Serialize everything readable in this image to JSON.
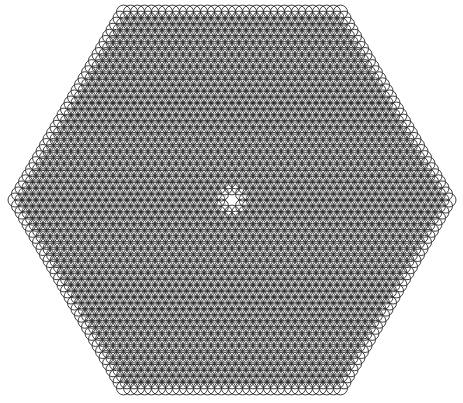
{
  "figure": {
    "name": "hexagonal-overlapping-circle-lattice",
    "title": "Hexagonal lattice of overlapping circles"
  },
  "canvas": {
    "width": 463,
    "height": 403,
    "background_color": "#ffffff"
  },
  "style": {
    "stroke_color": "#2b2b2b",
    "stroke_width": 0.9,
    "fill": "none"
  },
  "chart_data": {
    "type": "scatter",
    "title": "Hexagonal lattice of overlapping circles",
    "xlabel": "",
    "ylabel": "",
    "grid": false,
    "legend": null,
    "annotations": [
      "flat-top hexagonal boundary",
      "six-pointed star void at centre",
      "moire interference rosettes"
    ],
    "lattice": {
      "kind": "triangular",
      "center_x": 232.0,
      "center_y": 200.0,
      "spacing_x": 7.0,
      "spacing_y": 6.062,
      "circle_radius": 7.0,
      "rows": 62,
      "hexagon_flat_top": true,
      "hexagon_half_width": 218,
      "hexagon_half_height": 188,
      "top_edge_y": 13,
      "bottom_edge_y": 387,
      "left_vertex_x": 14,
      "right_vertex_x": 450,
      "top_edge_x_start": 122,
      "top_edge_x_end": 341,
      "center_star_radius": 11
    },
    "xlim": [
      0,
      463
    ],
    "ylim": [
      0,
      403
    ]
  }
}
